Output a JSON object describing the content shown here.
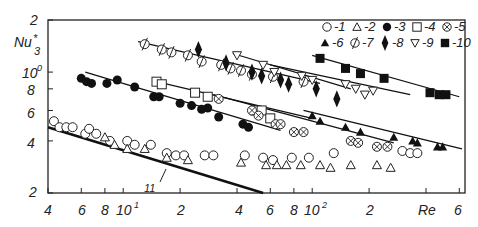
{
  "chart_data": {
    "type": "scatter",
    "title": "",
    "xlabel": "Re",
    "ylabel": "Nu*_3",
    "xscale": "log",
    "yscale": "log",
    "xlim": [
      4,
      600
    ],
    "ylim": [
      2,
      20
    ],
    "x_ticks": [
      "4",
      "6",
      "8",
      "10^1",
      "2",
      "4",
      "6",
      "8",
      "10^2",
      "2",
      "Re",
      "6"
    ],
    "y_ticks": [
      "2",
      "Nu*3",
      "10^0",
      "8",
      "6",
      "4",
      "2"
    ],
    "grid": false,
    "legend_position": "top-right inside",
    "legend": [
      "1",
      "2",
      "3",
      "4",
      "5",
      "6",
      "7",
      "8",
      "9",
      "10"
    ],
    "annotations": [
      "11"
    ],
    "series": [
      {
        "name": "1",
        "marker": "open-circle",
        "points": [
          [
            4.3,
            5.2
          ],
          [
            4.6,
            4.8
          ],
          [
            5,
            4.8
          ],
          [
            5.4,
            4.8
          ],
          [
            6.3,
            4.4
          ],
          [
            6.6,
            4.7
          ],
          [
            7.2,
            4.4
          ],
          [
            8.5,
            4.0
          ],
          [
            10.5,
            4.0
          ],
          [
            11.5,
            3.8
          ],
          [
            14,
            3.8
          ],
          [
            17,
            3.4
          ],
          [
            19,
            3.3
          ],
          [
            21,
            3.3
          ],
          [
            27,
            3.3
          ],
          [
            30,
            3.3
          ],
          [
            44,
            3.3
          ],
          [
            55,
            3.2
          ],
          [
            62,
            3.1
          ],
          [
            78,
            3.2
          ],
          [
            96,
            3.2
          ],
          [
            130,
            3.4
          ],
          [
            300,
            3.5
          ],
          [
            330,
            3.4
          ],
          [
            360,
            3.4
          ]
        ]
      },
      {
        "name": "2",
        "marker": "open-triangle",
        "points": [
          [
            8,
            4.2
          ],
          [
            9,
            3.8
          ],
          [
            10.5,
            3.6
          ],
          [
            13,
            3.6
          ],
          [
            17,
            3.2
          ],
          [
            22,
            3.1
          ],
          [
            42,
            3.0
          ],
          [
            57,
            2.9
          ],
          [
            65,
            2.9
          ],
          [
            73,
            2.9
          ],
          [
            87,
            2.9
          ],
          [
            110,
            2.9
          ],
          [
            125,
            2.8
          ],
          [
            160,
            2.9
          ],
          [
            220,
            2.9
          ],
          [
            260,
            2.8
          ]
        ]
      },
      {
        "name": "3",
        "marker": "filled-circle",
        "points": [
          [
            6,
            9.2
          ],
          [
            6.4,
            8.8
          ],
          [
            6.8,
            8.6
          ],
          [
            8.2,
            8.6
          ],
          [
            9.3,
            9.0
          ],
          [
            11.5,
            8.2
          ],
          [
            14.5,
            7.2
          ],
          [
            15.5,
            7.2
          ],
          [
            20,
            6.6
          ],
          [
            23,
            6.4
          ],
          [
            26,
            6.1
          ],
          [
            28,
            6.2
          ],
          [
            32,
            5.5
          ],
          [
            43,
            5.0
          ],
          [
            46,
            4.8
          ]
        ]
      },
      {
        "name": "4",
        "marker": "open-square",
        "points": [
          [
            15,
            8.8
          ],
          [
            16,
            8.5
          ],
          [
            24,
            7.6
          ],
          [
            28,
            7.2
          ],
          [
            50,
            6.0
          ],
          [
            54,
            6.0
          ],
          [
            60,
            5.4
          ]
        ]
      },
      {
        "name": "5",
        "marker": "crossed-circle",
        "points": [
          [
            32,
            7.0
          ],
          [
            48,
            6.0
          ],
          [
            52,
            5.6
          ],
          [
            64,
            5.0
          ],
          [
            68,
            5.0
          ],
          [
            80,
            4.5
          ],
          [
            90,
            4.5
          ],
          [
            160,
            4.0
          ],
          [
            175,
            3.9
          ],
          [
            220,
            3.7
          ],
          [
            250,
            3.7
          ]
        ]
      },
      {
        "name": "6",
        "marker": "filled-triangle",
        "points": [
          [
            100,
            5.6
          ],
          [
            110,
            5.2
          ],
          [
            150,
            4.8
          ],
          [
            180,
            4.5
          ],
          [
            270,
            4.2
          ],
          [
            340,
            4.0
          ],
          [
            360,
            3.9
          ],
          [
            460,
            3.7
          ],
          [
            490,
            3.7
          ]
        ]
      },
      {
        "name": "7",
        "marker": "slashed-circle",
        "points": [
          [
            13,
            14.5
          ],
          [
            16,
            13.5
          ],
          [
            18,
            13
          ],
          [
            22,
            12.5
          ],
          [
            26,
            11.5
          ],
          [
            33,
            11
          ],
          [
            37,
            10.5
          ],
          [
            42,
            10.2
          ],
          [
            48,
            9.7
          ],
          [
            62,
            9.4
          ],
          [
            90,
            8.8
          ]
        ]
      },
      {
        "name": "8",
        "marker": "filled-diamond",
        "points": [
          [
            25,
            13.5
          ],
          [
            35,
            11.3
          ],
          [
            48,
            10.0
          ],
          [
            54,
            9.5
          ],
          [
            68,
            9.0
          ],
          [
            75,
            8.5
          ],
          [
            105,
            8.0
          ],
          [
            135,
            7.0
          ]
        ]
      },
      {
        "name": "9",
        "marker": "open-down-triangle",
        "points": [
          [
            40,
            12.5
          ],
          [
            55,
            11.0
          ],
          [
            63,
            10.0
          ],
          [
            88,
            9.5
          ],
          [
            100,
            9.0
          ],
          [
            150,
            8.5
          ],
          [
            170,
            8.0
          ],
          [
            190,
            7.4
          ],
          [
            210,
            7.8
          ]
        ]
      },
      {
        "name": "10",
        "marker": "filled-square",
        "points": [
          [
            110,
            12.0
          ],
          [
            150,
            10.5
          ],
          [
            180,
            9.8
          ],
          [
            240,
            9.2
          ],
          [
            420,
            7.6
          ],
          [
            470,
            7.4
          ],
          [
            510,
            7.4
          ]
        ]
      }
    ],
    "fit_lines": [
      {
        "for": "7",
        "from": [
          12,
          15
        ],
        "to": [
          110,
          8.6
        ]
      },
      {
        "for": "8",
        "from": [
          38,
          12.8
        ],
        "to": [
          160,
          8.0
        ]
      },
      {
        "for": "9",
        "from": [
          60,
          11.0
        ],
        "to": [
          330,
          7.4
        ]
      },
      {
        "for": "10",
        "from": [
          100,
          12.5
        ],
        "to": [
          600,
          7.2
        ]
      },
      {
        "for": "3",
        "from": [
          6.3,
          10
        ],
        "to": [
          68,
          4.6
        ]
      },
      {
        "for": "4",
        "from": [
          15,
          8.8
        ],
        "to": [
          100,
          5.4
        ]
      },
      {
        "for": "5",
        "from": [
          30,
          7.4
        ],
        "to": [
          270,
          3.9
        ]
      },
      {
        "for": "6",
        "from": [
          90,
          6.0
        ],
        "to": [
          620,
          3.6
        ]
      },
      {
        "for": "11",
        "from": [
          4,
          4.8
        ],
        "to": [
          55,
          2.0
        ],
        "bold": true
      }
    ]
  }
}
